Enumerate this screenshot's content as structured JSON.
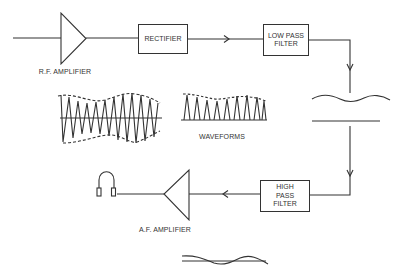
{
  "colors": {
    "line": "#333333",
    "background": "#ffffff"
  },
  "blocks": {
    "rf_amplifier": {
      "label": "R.F. AMPLIFIER",
      "icon": "triangle-amplifier-icon"
    },
    "rectifier": {
      "label": "RECTIFIER"
    },
    "low_pass_filter": {
      "line1": "LOW PASS",
      "line2": "FILTER"
    },
    "capacitor": {
      "icon": "capacitor-wave-icon"
    },
    "high_pass_filter": {
      "line1": "HIGH",
      "line2": "PASS",
      "line3": "FILTER"
    },
    "af_amplifier": {
      "label": "A.F. AMPLIFIER",
      "icon": "triangle-amplifier-icon"
    },
    "headphones": {
      "icon": "headphones-icon"
    }
  },
  "waveforms": {
    "label": "WAVEFORMS",
    "items": [
      "modulated-rf-wave",
      "rectified-wave",
      "audio-output-wave"
    ]
  }
}
